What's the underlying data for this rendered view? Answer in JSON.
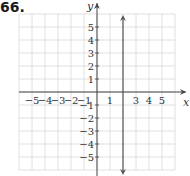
{
  "problem": {
    "number": "66."
  },
  "chart_data": {
    "type": "line",
    "title": "",
    "xlabel": "x",
    "ylabel": "y",
    "xlim": [
      -6,
      6
    ],
    "ylim": [
      -6,
      6
    ],
    "grid": true,
    "x_tick_labels": [
      "-5",
      "-4",
      "-3",
      "-2",
      "-1",
      "1",
      "3",
      "4",
      "5"
    ],
    "y_tick_labels": [
      "5",
      "4",
      "3",
      "2",
      "1",
      "-1",
      "-2",
      "-3",
      "-4",
      "-5"
    ],
    "series": [
      {
        "name": "x = 2",
        "kind": "vertical-line",
        "x": 2,
        "y_range": [
          -6,
          6
        ],
        "arrows": "both"
      }
    ],
    "colors": {
      "grid": "#d8d8d8",
      "axis": "#444444",
      "line": "#555555"
    }
  }
}
